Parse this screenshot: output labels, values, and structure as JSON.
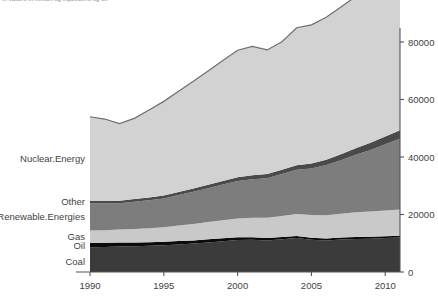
{
  "title_clipped": "in values in million kg equivalent kg oil",
  "chart_data": {
    "type": "area",
    "stacked": true,
    "title": "",
    "xlabel": "",
    "ylabel": "",
    "xlim": [
      1989,
      2012
    ],
    "ylim": [
      0,
      90000
    ],
    "yticks": [
      0,
      20000,
      40000,
      60000,
      80000
    ],
    "ytick_labels": [
      "0",
      "20000",
      "40000",
      "60000",
      "80000"
    ],
    "xticks": [
      1990,
      1995,
      2000,
      2005,
      2010
    ],
    "xtick_labels": [
      "1990",
      "1995",
      "2000",
      "2005",
      "2010"
    ],
    "grid": false,
    "legend_position": "left-inline",
    "axis_position": "right",
    "x": [
      1990,
      1991,
      1992,
      1993,
      1994,
      1995,
      1996,
      1997,
      1998,
      1999,
      2000,
      2001,
      2002,
      2003,
      2004,
      2005,
      2006,
      2007,
      2008,
      2009,
      2010,
      2011
    ],
    "series": [
      {
        "name": "Coal",
        "label": "Coal",
        "color": "#3b3b3b",
        "values": [
          8600,
          8700,
          8900,
          9000,
          9100,
          9300,
          9600,
          9900,
          10300,
          10700,
          11100,
          11200,
          11000,
          11400,
          11800,
          11200,
          11000,
          11300,
          11500,
          11600,
          11800,
          12000
        ]
      },
      {
        "name": "Oil",
        "label": "Oil",
        "color": "#0b0b0b",
        "values": [
          1600,
          1500,
          1400,
          1300,
          1250,
          1200,
          1150,
          1100,
          1050,
          1000,
          950,
          900,
          850,
          800,
          750,
          700,
          680,
          660,
          640,
          620,
          600,
          580
        ]
      },
      {
        "name": "Gas",
        "label": "Gas",
        "color": "#c9c9c9",
        "values": [
          4200,
          4300,
          4500,
          4700,
          4900,
          5100,
          5400,
          5700,
          6000,
          6300,
          6600,
          6800,
          7000,
          7300,
          7600,
          7900,
          8100,
          8300,
          8600,
          8800,
          9000,
          9200
        ]
      },
      {
        "name": "Renewable.Energies",
        "label": "Renewable.Energies",
        "color": "#7d7d7d",
        "values": [
          9500,
          9300,
          9100,
          9400,
          9700,
          10000,
          10600,
          11200,
          11800,
          12400,
          13000,
          13400,
          13800,
          14600,
          15400,
          16200,
          17400,
          18600,
          20000,
          21400,
          23000,
          24600
        ]
      },
      {
        "name": "Other",
        "label": "Other",
        "color": "#4a4a4a",
        "values": [
          900,
          900,
          900,
          950,
          1000,
          1050,
          1100,
          1150,
          1200,
          1250,
          1300,
          1350,
          1400,
          1500,
          1600,
          1750,
          1900,
          2100,
          2300,
          2500,
          2700,
          2900
        ]
      },
      {
        "name": "Nuclear.Energy",
        "label": "Nuclear.Energy",
        "color": "#d2d2d2",
        "values": [
          29200,
          28500,
          26800,
          28100,
          30400,
          32700,
          35000,
          37300,
          39600,
          41900,
          44200,
          44800,
          43200,
          44500,
          47800,
          48200,
          49500,
          51200,
          52800,
          53800,
          55000,
          52500
        ]
      }
    ]
  },
  "axis": {
    "y_tick_values": [
      "80000",
      "60000",
      "40000",
      "20000",
      "0"
    ],
    "x_tick_values": [
      "1990",
      "1995",
      "2000",
      "2005",
      "2010"
    ]
  }
}
